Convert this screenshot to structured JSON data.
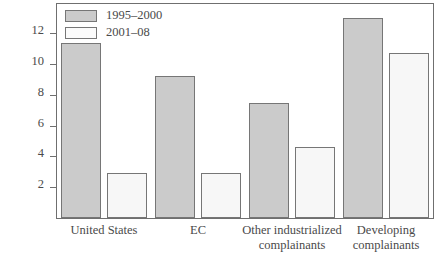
{
  "chart_data": {
    "type": "bar",
    "title": "",
    "subtitle": "",
    "xlabel": "",
    "ylabel": "",
    "categories": [
      "United States",
      "EC",
      "Other industrialized complainants",
      "Developing complainants"
    ],
    "category_lines": [
      [
        "United States"
      ],
      [
        "EC"
      ],
      [
        "Other industrialized",
        "complainants"
      ],
      [
        "Developing",
        "complainants"
      ]
    ],
    "series": [
      {
        "name": "1995–2000",
        "color": "#cbcbcb",
        "values": [
          11.35,
          9.2,
          7.5,
          13.0
        ]
      },
      {
        "name": "2001–08",
        "color": "#f7f7f7",
        "values": [
          2.9,
          2.9,
          4.6,
          10.7
        ]
      }
    ],
    "ylim": [
      0,
      13.9
    ],
    "yticks": [
      2,
      4,
      6,
      8,
      10,
      12
    ],
    "ytick_labels": [
      "2",
      "4",
      "6",
      "8",
      "10",
      "12"
    ],
    "grid": false,
    "legend_position": "top-left",
    "legend": [
      {
        "label": "1995–2000",
        "swatch": "filled-gray"
      },
      {
        "label": "2001–08",
        "swatch": "empty-white"
      }
    ],
    "frame": {
      "top": true,
      "left": true,
      "right": true,
      "bottom": true
    },
    "bar_border_color": "#767676",
    "axis_color": "#6f6f6f",
    "text_color": "#4a4a4a"
  }
}
